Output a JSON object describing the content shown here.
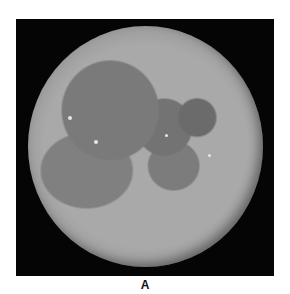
{
  "figure": {
    "label": "A",
    "background_color": "#050505"
  }
}
